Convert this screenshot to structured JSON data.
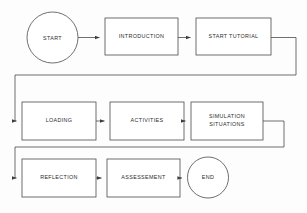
{
  "diagram": {
    "type": "flowchart",
    "canvas": {
      "width": 307,
      "height": 213
    },
    "style": {
      "background_color": "#fdfdfd",
      "stroke_color": "#4a4a4a",
      "text_color": "#2b2b2b",
      "fill_color": "#ffffff",
      "stroke_width": 0.8
    },
    "nodes": [
      {
        "id": "start",
        "label": "START",
        "shape": "circle",
        "cx": 52.5,
        "cy": 37.5,
        "r": 25.5,
        "row": 1
      },
      {
        "id": "introduction",
        "label": "INTRODUCTION",
        "shape": "rectangle",
        "x": 105,
        "y": 18,
        "w": 73,
        "h": 37,
        "row": 1
      },
      {
        "id": "start-tutorial",
        "label": "START TUTORIAL",
        "shape": "rectangle",
        "x": 196,
        "y": 18,
        "w": 75,
        "h": 37,
        "row": 1
      },
      {
        "id": "loading",
        "label": "LOADING",
        "shape": "rectangle",
        "x": 22,
        "y": 102,
        "w": 74,
        "h": 38,
        "row": 2
      },
      {
        "id": "activities",
        "label": "ACTIVITIES",
        "shape": "rectangle",
        "x": 110,
        "y": 102,
        "w": 74,
        "h": 38,
        "row": 2
      },
      {
        "id": "simulation-situations",
        "label": "SIMULATION\nSITUATIONS",
        "shape": "rectangle",
        "x": 191,
        "y": 102,
        "w": 72,
        "h": 38,
        "row": 2
      },
      {
        "id": "reflection",
        "label": "REFLECTION",
        "shape": "rectangle",
        "x": 22,
        "y": 159,
        "w": 74,
        "h": 38,
        "row": 3
      },
      {
        "id": "assessement",
        "label": "ASSESSEMENT",
        "shape": "rectangle",
        "x": 107,
        "y": 159,
        "w": 73,
        "h": 38,
        "row": 3
      },
      {
        "id": "end",
        "label": "END",
        "shape": "circle",
        "cx": 208,
        "cy": 177.5,
        "r": 20.5,
        "row": 3
      }
    ],
    "edges": [
      {
        "id": "start-to-introduction",
        "from": "start",
        "to": "introduction",
        "kind": "straight",
        "arrow": true
      },
      {
        "id": "introduction-to-start-tutorial",
        "from": "introduction",
        "to": "start-tutorial",
        "kind": "straight",
        "arrow": true
      },
      {
        "id": "start-tutorial-to-loading",
        "from": "start-tutorial",
        "to": "loading",
        "kind": "wrap",
        "arrow": true
      },
      {
        "id": "loading-to-activities",
        "from": "loading",
        "to": "activities",
        "kind": "straight",
        "arrow": true
      },
      {
        "id": "activities-to-simulation-situations",
        "from": "activities",
        "to": "simulation-situations",
        "kind": "straight",
        "arrow": true
      },
      {
        "id": "simulation-situations-to-reflection",
        "from": "simulation-situations",
        "to": "reflection",
        "kind": "wrap",
        "arrow": true
      },
      {
        "id": "reflection-to-assessement",
        "from": "reflection",
        "to": "assessement",
        "kind": "straight",
        "arrow": true
      },
      {
        "id": "assessement-to-end",
        "from": "assessement",
        "to": "end",
        "kind": "straight",
        "arrow": true
      }
    ]
  }
}
